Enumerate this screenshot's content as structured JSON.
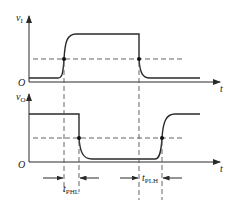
{
  "diagram": {
    "type": "timing-diagram",
    "input_axis": {
      "label": "v",
      "subscript": "I"
    },
    "output_axis": {
      "label": "v",
      "subscript": "O"
    },
    "origin_label": "O",
    "time_label": "t",
    "delays": [
      {
        "label": "t",
        "subscript": "PHL"
      },
      {
        "label": "t",
        "subscript": "PLH"
      }
    ],
    "colors": {
      "line": "#2a2a2a",
      "dash": "#555555",
      "background": "#ffffff"
    }
  }
}
